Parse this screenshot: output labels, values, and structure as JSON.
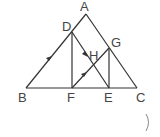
{
  "diagram": {
    "type": "geometry-triangle",
    "stroke_color": "#333333",
    "points": {
      "A": {
        "label": "A",
        "x": 86,
        "y": 14
      },
      "B": {
        "label": "B",
        "x": 26,
        "y": 88
      },
      "C": {
        "label": "C",
        "x": 137,
        "y": 88
      },
      "D": {
        "label": "D",
        "x": 72,
        "y": 32
      },
      "E": {
        "label": "E",
        "x": 109,
        "y": 88
      },
      "F": {
        "label": "F",
        "x": 72,
        "y": 88
      },
      "G": {
        "label": "G",
        "x": 109,
        "y": 48
      },
      "H": {
        "label": "H",
        "x": 92,
        "y": 61
      }
    },
    "segments": [
      "AB",
      "AC",
      "BC",
      "DF",
      "DE",
      "FG",
      "GE"
    ],
    "parallel_marks": [
      "AB",
      "DE",
      "FG"
    ],
    "extra_mark": ")"
  }
}
